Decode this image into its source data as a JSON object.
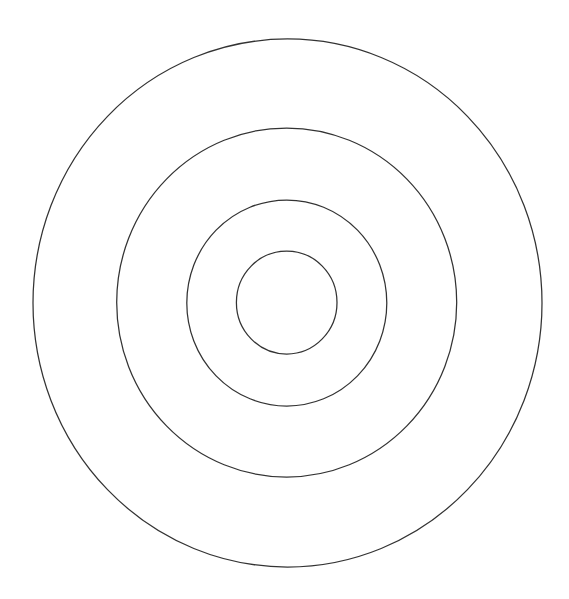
{
  "canvas": {
    "width": 569,
    "height": 599,
    "background": "#ffffff"
  },
  "diagram": {
    "type": "concentric-circles",
    "stroke_color": "#333333",
    "center": {
      "x": 287,
      "y": 303
    },
    "rings": [
      {
        "name": "outer-ring",
        "cx": 287.5,
        "cy": 303,
        "rx": 254.5,
        "ry": 264
      },
      {
        "name": "second-ring",
        "cx": 286.7,
        "cy": 302.5,
        "rx": 170,
        "ry": 174.5
      },
      {
        "name": "third-ring",
        "cx": 286.8,
        "cy": 303,
        "rx": 100,
        "ry": 103
      },
      {
        "name": "inner-ring",
        "cx": 286.7,
        "cy": 302.5,
        "rx": 50.3,
        "ry": 51.5
      }
    ]
  }
}
